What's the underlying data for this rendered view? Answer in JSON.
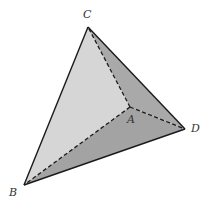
{
  "diagram": {
    "vertices": {
      "A": {
        "label": "A",
        "x": 130,
        "y": 107,
        "label_x": 127,
        "label_y": 123
      },
      "B": {
        "label": "B",
        "x": 24,
        "y": 185,
        "label_x": 9,
        "label_y": 196
      },
      "C": {
        "label": "C",
        "x": 88,
        "y": 27,
        "label_x": 83,
        "label_y": 18
      },
      "D": {
        "label": "D",
        "x": 185,
        "y": 129,
        "label_x": 191,
        "label_y": 132
      }
    },
    "faces": [
      {
        "name": "ABC",
        "color": "#d6d6d6"
      },
      {
        "name": "ACD",
        "color": "#a9a9a9"
      },
      {
        "name": "ABD",
        "color": "#a3a3a3"
      }
    ],
    "edges": {
      "solid": [
        "CB",
        "CD",
        "BD"
      ],
      "dashed": [
        "AB",
        "AC",
        "AD"
      ]
    },
    "colors": {
      "edge": "#1a1a1a",
      "label": "#333333",
      "background": "#ffffff"
    }
  }
}
